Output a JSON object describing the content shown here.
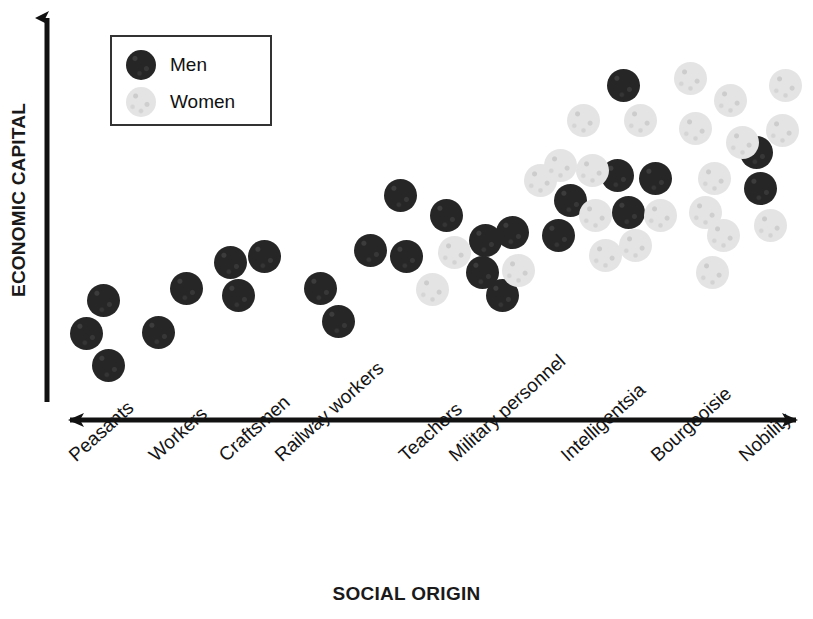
{
  "chart_data": {
    "type": "scatter",
    "title": "",
    "xlabel": "SOCIAL ORIGIN",
    "ylabel": "ECONOMIC CAPITAL",
    "grid": false,
    "legend_position": "top-left",
    "axis_style": "arrow",
    "xlim_note": "ordinal axis, 9 social-origin categories ordered low to high",
    "ylim_note": "unlabeled ordinal scale, low at bottom to high at top",
    "categories": [
      "Peasants",
      "Workers",
      "Craftsmen",
      "Railway workers",
      "Teachers",
      "Military personnel",
      "Intelligentsia",
      "Bourgeoisie",
      "Nobility"
    ],
    "series": [
      {
        "name": "Men",
        "color": "#262626",
        "points": [
          {
            "category": "Peasants",
            "px": 103,
            "py": 300
          },
          {
            "category": "Peasants",
            "px": 86,
            "py": 333
          },
          {
            "category": "Peasants",
            "px": 108,
            "py": 365
          },
          {
            "category": "Workers",
            "px": 158,
            "py": 332
          },
          {
            "category": "Workers",
            "px": 186,
            "py": 288
          },
          {
            "category": "Craftsmen",
            "px": 230,
            "py": 262
          },
          {
            "category": "Craftsmen",
            "px": 264,
            "py": 256
          },
          {
            "category": "Craftsmen",
            "px": 238,
            "py": 295
          },
          {
            "category": "Railway workers",
            "px": 320,
            "py": 288
          },
          {
            "category": "Railway workers",
            "px": 338,
            "py": 321
          },
          {
            "category": "Teachers",
            "px": 400,
            "py": 195
          },
          {
            "category": "Teachers",
            "px": 446,
            "py": 215
          },
          {
            "category": "Teachers",
            "px": 370,
            "py": 250
          },
          {
            "category": "Teachers",
            "px": 406,
            "py": 256
          },
          {
            "category": "Military personnel",
            "px": 485,
            "py": 240
          },
          {
            "category": "Military personnel",
            "px": 512,
            "py": 232
          },
          {
            "category": "Military personnel",
            "px": 482,
            "py": 272
          },
          {
            "category": "Military personnel",
            "px": 502,
            "py": 295
          },
          {
            "category": "Military personnel",
            "px": 558,
            "py": 235
          },
          {
            "category": "Military personnel",
            "px": 570,
            "py": 200
          },
          {
            "category": "Intelligentsia",
            "px": 623,
            "py": 85
          },
          {
            "category": "Intelligentsia",
            "px": 617,
            "py": 175
          },
          {
            "category": "Intelligentsia",
            "px": 655,
            "py": 178
          },
          {
            "category": "Intelligentsia",
            "px": 628,
            "py": 212
          },
          {
            "category": "Nobility",
            "px": 756,
            "py": 152
          },
          {
            "category": "Nobility",
            "px": 760,
            "py": 188
          }
        ]
      },
      {
        "name": "Women",
        "color": "#e4e4e4",
        "points": [
          {
            "category": "Teachers",
            "px": 432,
            "py": 289
          },
          {
            "category": "Teachers",
            "px": 454,
            "py": 252
          },
          {
            "category": "Military personnel",
            "px": 518,
            "py": 270
          },
          {
            "category": "Military personnel",
            "px": 540,
            "py": 180
          },
          {
            "category": "Military personnel",
            "px": 560,
            "py": 165
          },
          {
            "category": "Military personnel",
            "px": 595,
            "py": 215
          },
          {
            "category": "Military personnel",
            "px": 605,
            "py": 255
          },
          {
            "category": "Intelligentsia",
            "px": 583,
            "py": 120
          },
          {
            "category": "Intelligentsia",
            "px": 592,
            "py": 170
          },
          {
            "category": "Intelligentsia",
            "px": 640,
            "py": 120
          },
          {
            "category": "Intelligentsia",
            "px": 690,
            "py": 78
          },
          {
            "category": "Intelligentsia",
            "px": 695,
            "py": 128
          },
          {
            "category": "Intelligentsia",
            "px": 660,
            "py": 215
          },
          {
            "category": "Intelligentsia",
            "px": 635,
            "py": 245
          },
          {
            "category": "Intelligentsia",
            "px": 705,
            "py": 212
          },
          {
            "category": "Bourgeoisie",
            "px": 730,
            "py": 100
          },
          {
            "category": "Bourgeoisie",
            "px": 742,
            "py": 142
          },
          {
            "category": "Bourgeoisie",
            "px": 714,
            "py": 178
          },
          {
            "category": "Bourgeoisie",
            "px": 723,
            "py": 235
          },
          {
            "category": "Bourgeoisie",
            "px": 712,
            "py": 272
          },
          {
            "category": "Nobility",
            "px": 785,
            "py": 85
          },
          {
            "category": "Nobility",
            "px": 782,
            "py": 130
          },
          {
            "category": "Nobility",
            "px": 770,
            "py": 225
          }
        ]
      }
    ],
    "observation": "Economic capital rises with social origin; women appear only from Teachers rightward and dominate the highest-origin categories."
  },
  "legend": {
    "entries": [
      {
        "label": "Men",
        "color": "#262626"
      },
      {
        "label": "Women",
        "color": "#e4e4e4"
      }
    ]
  },
  "axes": {
    "y_title": "ECONOMIC CAPITAL",
    "x_title": "SOCIAL ORIGIN"
  }
}
